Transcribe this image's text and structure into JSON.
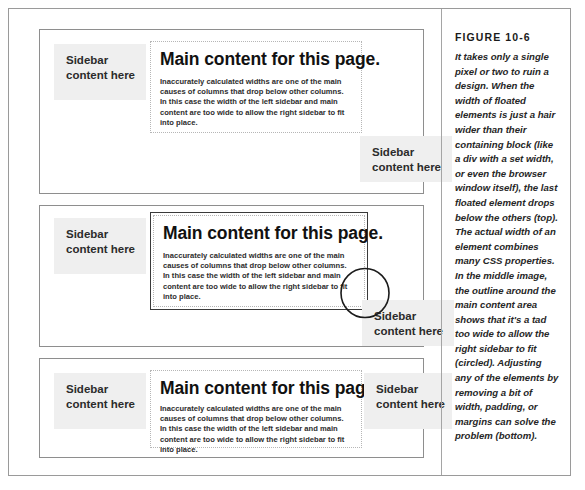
{
  "figure": {
    "label": "FIGURE 10-6",
    "caption": "It takes only a single pixel or two to ruin a design. When the width of floated elements is just a hair wider than their containing block (like a div with a set width, or even the browser window itself), the last floated element drops below the others (top). The actual width of an element combines many CSS properties. In the middle image, the outline around the main content area shows that it's a tad too wide to allow the right sidebar to fit (circled). Adjusting any of the elements by removing a bit of width, padding, or margins can solve the problem (bottom)."
  },
  "common": {
    "sidebar_text": "Sidebar\ncontent here",
    "main_heading": "Main content for this page.",
    "main_paragraph": "Inaccurately calculated widths are one of the main causes of columns that drop below other columns. In this case the width of the left sidebar and main content are too wide to allow the right sidebar to fit into place."
  },
  "panels": [
    {
      "name": "top",
      "state": "right-sidebar-dropped",
      "left_sidebar": "Sidebar\ncontent here",
      "heading": "Main content for this page.",
      "paragraph": "Inaccurately calculated widths are one of the main causes of columns that drop below other columns. In this case the width of the left sidebar and main content are too wide to allow the right sidebar to fit into place.",
      "right_sidebar": "Sidebar\ncontent here"
    },
    {
      "name": "middle",
      "state": "main-content-outlined-and-circled",
      "left_sidebar": "Sidebar\ncontent here",
      "heading": "Main content for this page.",
      "paragraph": "Inaccurately calculated widths are one of the main causes of columns that drop below other columns. In this case the width of the left sidebar and main content are too wide to allow the right sidebar to fit into place.",
      "right_sidebar": "Sidebar\ncontent here"
    },
    {
      "name": "bottom",
      "state": "all-columns-fit",
      "left_sidebar": "Sidebar\ncontent here",
      "heading": "Main content for this page.",
      "paragraph": "Inaccurately calculated widths are one of the main causes of columns that drop below other columns. In this case the width of the left sidebar and main content are too wide to allow the right sidebar to fit into place.",
      "right_sidebar": "Sidebar\ncontent here"
    }
  ],
  "colors": {
    "sidebar_background": "#efefef",
    "panel_border": "#8e8e8e",
    "figure_border": "#9a9a9a",
    "outline_highlight": "#3a3a3a",
    "dotted_border": "#b6b6b6",
    "text": "#2b2b2b"
  }
}
